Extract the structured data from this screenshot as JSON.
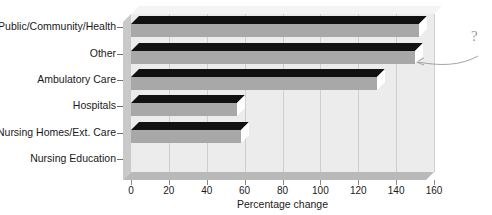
{
  "chart_data": {
    "type": "bar",
    "orientation": "horizontal",
    "title": "",
    "xlabel": "Percentage change",
    "ylabel": "",
    "xlim": [
      0,
      160
    ],
    "xticks": [
      0,
      20,
      40,
      60,
      80,
      100,
      120,
      140,
      160
    ],
    "grid": true,
    "legend": null,
    "categories": [
      "Public/Community/Health",
      "Other",
      "Ambulatory Care",
      "Hospitals",
      "Nursing Homes/Ext. Care",
      "Nursing Education"
    ],
    "values": [
      152,
      150,
      130,
      56,
      58,
      0
    ],
    "annotations": [
      {
        "text": "?",
        "points_to": "Other"
      }
    ]
  },
  "axis": {
    "x_title": "Percentage change",
    "tick_labels": [
      "0",
      "20",
      "40",
      "60",
      "80",
      "100",
      "120",
      "140",
      "160"
    ]
  },
  "annotation": {
    "question_mark": "?"
  }
}
